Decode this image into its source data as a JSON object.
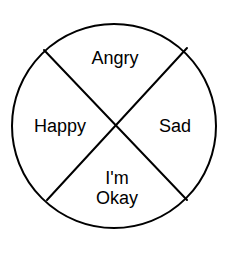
{
  "figure": {
    "type": "emotion-wheel",
    "background_color": "#ffffff",
    "stroke_color": "#000000",
    "text_color": "#000000",
    "circle": {
      "center_x": 114,
      "center_y": 126,
      "radius": 102,
      "stroke_width": 2,
      "fill": "#ffffff"
    },
    "dividers": [
      {
        "name": "diagonal-nw-se",
        "x1": 44,
        "y1": 50,
        "x2": 187,
        "y2": 200
      },
      {
        "name": "diagonal-ne-sw",
        "x1": 187,
        "y1": 48,
        "x2": 47,
        "y2": 200
      }
    ],
    "sectors": [
      {
        "id": "top",
        "label": "Angry",
        "center_x": 115,
        "center_y": 58
      },
      {
        "id": "left",
        "label": "Happy",
        "center_x": 60,
        "center_y": 126
      },
      {
        "id": "right",
        "label": "Sad",
        "center_x": 175,
        "center_y": 126
      },
      {
        "id": "bottom",
        "label": "I'm\nOkay",
        "center_x": 117,
        "center_y": 188
      }
    ]
  }
}
